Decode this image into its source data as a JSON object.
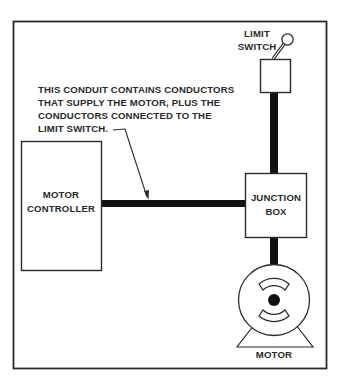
{
  "diagram": {
    "colors": {
      "line": "#2a2a2a",
      "conduit": "#111111",
      "background": "#ffffff"
    },
    "annotation": {
      "lines": [
        "THIS CONDUIT CONTAINS CONDUCTORS",
        "THAT SUPPLY THE MOTOR, PLUS THE",
        "CONDUCTORS CONNECTED TO THE",
        "LIMIT SWITCH."
      ]
    },
    "limit_switch": {
      "label_line1": "LIMIT",
      "label_line2": "SWITCH",
      "icon": "toggle-lever-icon"
    },
    "motor_controller": {
      "label_line1": "MOTOR",
      "label_line2": "CONTROLLER"
    },
    "junction_box": {
      "label_line1": "JUNCTION",
      "label_line2": "BOX"
    },
    "motor": {
      "label": "MOTOR",
      "icon": "motor-icon"
    }
  }
}
